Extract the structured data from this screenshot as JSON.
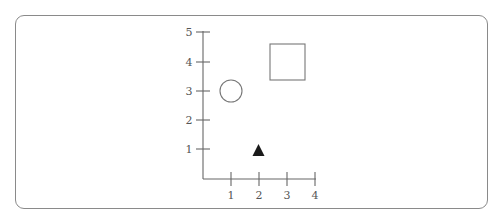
{
  "header": {
    "cutoff_text": "· · · · · · · · · · · · · · · · · · · · · · · · · · · · ·"
  },
  "diagram": {
    "type": "coordinate-grid",
    "x_axis": {
      "ticks": [
        "1",
        "2",
        "3",
        "4"
      ]
    },
    "y_axis": {
      "ticks": [
        "1",
        "2",
        "3",
        "4",
        "5"
      ]
    },
    "shapes": [
      {
        "name": "circle",
        "fill": "none",
        "x": 1,
        "y": 3
      },
      {
        "name": "square",
        "fill": "none",
        "x": 3,
        "y": 4
      },
      {
        "name": "triangle",
        "fill": "#1a1a1a",
        "x": 2,
        "y": 1
      }
    ],
    "colors": {
      "axis": "#666666",
      "shape_stroke": "#777777",
      "triangle_fill": "#1a1a1a",
      "frame": "#8a8a8a"
    }
  }
}
